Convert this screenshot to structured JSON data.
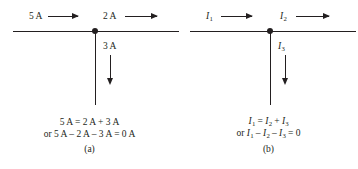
{
  "figure": {
    "line_color": "#231f20",
    "background_color": "#ffffff"
  },
  "panels": [
    {
      "tag": "(a)",
      "incoming_label": "5 A",
      "outgoing_label": "2 A",
      "branch_label": "3 A",
      "equation_line1": "5 A = 2 A + 3 A",
      "equation_line2": "or 5 A – 2 A – 3 A = 0 A",
      "symbolic": false
    },
    {
      "tag": "(b)",
      "incoming_symbol": "I",
      "incoming_sub": "1",
      "outgoing_symbol": "I",
      "outgoing_sub": "2",
      "branch_symbol": "I",
      "branch_sub": "3",
      "equation_line1_parts": {
        "s1": "I",
        "b1": "1",
        "op1": " = ",
        "s2": "I",
        "b2": "2",
        "op2": " + ",
        "s3": "I",
        "b3": "3"
      },
      "equation_line2_parts": {
        "prefix": "or ",
        "s1": "I",
        "b1": "1",
        "op1": " – ",
        "s2": "I",
        "b2": "2",
        "op2": " – ",
        "s3": "I",
        "b3": "3",
        "op3": " = 0"
      },
      "symbolic": true
    }
  ]
}
